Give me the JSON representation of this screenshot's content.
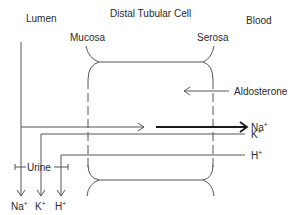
{
  "labels": {
    "title": "Distal Tubular Cell",
    "lumen": "Lumen",
    "blood": "Blood",
    "mucosa": "Mucosa",
    "serosa": "Serosa",
    "aldosterone": "Aldosterone",
    "urine": "Urine"
  },
  "ions": {
    "na": {
      "base": "Na",
      "charge": "+"
    },
    "k": {
      "base": "K",
      "charge": "+"
    },
    "h": {
      "base": "H",
      "charge": "+"
    }
  },
  "flows": [
    {
      "ion": "Na+",
      "direction": "lumen to blood",
      "emphasis": "thick arrow into blood"
    },
    {
      "ion": "K+",
      "direction": "blood to urine"
    },
    {
      "ion": "H+",
      "direction": "blood to urine"
    },
    {
      "signal": "Aldosterone",
      "direction": "blood to cell"
    }
  ],
  "colors": {
    "line": "#555555",
    "text": "#2a2a2a",
    "emphasis": "#1a1a1a",
    "background": "#ffffff"
  }
}
